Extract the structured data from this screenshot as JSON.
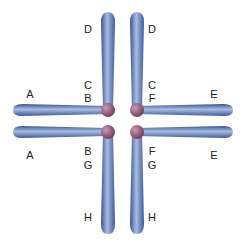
{
  "diagram": {
    "type": "tetrad",
    "colors": {
      "arm": "#4a6aa8",
      "arm_light": "#a8bde0",
      "centromere": "#8a4f72"
    },
    "labels": {
      "top_left_arm": "D",
      "top_right_arm": "D",
      "upper_left_inner_top": "C",
      "upper_left_inner_bottom": "B",
      "upper_right_inner_top": "C",
      "upper_right_inner_bottom": "F",
      "left_upper": "A",
      "left_lower": "A",
      "right_upper": "E",
      "right_lower": "E",
      "lower_left_inner_top": "B",
      "lower_left_inner_bottom": "G",
      "lower_right_inner_top": "F",
      "lower_right_inner_bottom": "G",
      "bottom_left_arm": "H",
      "bottom_right_arm": "H"
    }
  }
}
